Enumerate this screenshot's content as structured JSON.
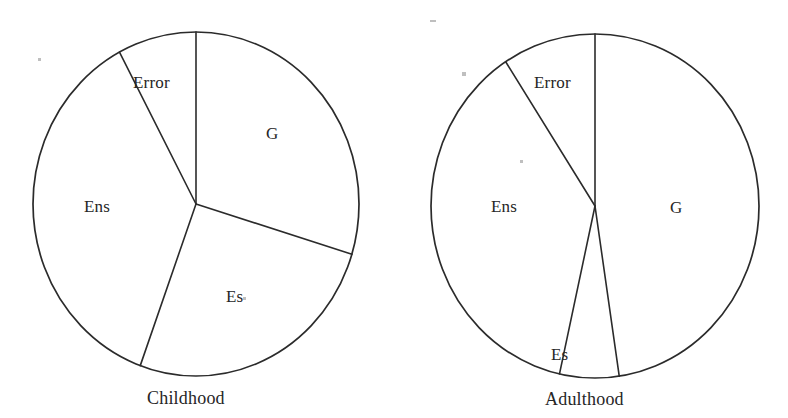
{
  "figure": {
    "background_color": "#ffffff",
    "line_color": "#2b2b2b",
    "text_color": "#262626"
  },
  "chart_data": [
    {
      "type": "pie",
      "title": "Childhood",
      "categories": [
        "G",
        "Es",
        "Ens",
        "Error"
      ],
      "values": [
        29.7,
        25.8,
        36.7,
        7.8
      ],
      "labels": [
        "G",
        "Es",
        "Ens",
        "Error"
      ],
      "units": "percent of variance",
      "legend": "none",
      "start_angle_deg": 90,
      "direction": "clockwise",
      "slice_boundaries_deg": [
        90,
        -17,
        -110,
        118
      ],
      "colors": [
        "#ffffff",
        "#ffffff",
        "#ffffff",
        "#ffffff"
      ],
      "outline_color": "#2b2b2b"
    },
    {
      "type": "pie",
      "title": "Adulthood",
      "categories": [
        "G",
        "Es",
        "Ens",
        "Error"
      ],
      "values": [
        47.5,
        6.1,
        33.6,
        12.8
      ],
      "labels": [
        "G",
        "Es",
        "Ens",
        "Error"
      ],
      "units": "percent of variance",
      "legend": "none",
      "start_angle_deg": 90,
      "direction": "clockwise",
      "slice_boundaries_deg": [
        90,
        -81,
        -103,
        123
      ],
      "colors": [
        "#ffffff",
        "#ffffff",
        "#ffffff",
        "#ffffff"
      ],
      "outline_color": "#2b2b2b"
    }
  ],
  "charts": [
    {
      "id": "childhood",
      "caption": "Childhood",
      "center": {
        "x": 196,
        "y": 204
      },
      "radius": {
        "x": 163,
        "y": 172
      },
      "caption_pos": {
        "x": 147,
        "y": 389
      },
      "boundaries_deg": [
        90,
        -17,
        -110,
        118
      ],
      "wedges": [
        {
          "name": "G",
          "label": "G",
          "label_pos": {
            "x": 266,
            "y": 125
          }
        },
        {
          "name": "Es",
          "label": "Es",
          "label_pos": {
            "x": 226,
            "y": 288
          }
        },
        {
          "name": "Ens",
          "label": "Ens",
          "label_pos": {
            "x": 84,
            "y": 198
          }
        },
        {
          "name": "Error",
          "label": "Error",
          "label_pos": {
            "x": 133,
            "y": 74
          }
        }
      ]
    },
    {
      "id": "adulthood",
      "caption": "Adulthood",
      "center": {
        "x": 595,
        "y": 206
      },
      "radius": {
        "x": 164,
        "y": 172
      },
      "caption_pos": {
        "x": 545,
        "y": 390
      },
      "boundaries_deg": [
        90,
        -81.5,
        -102.5,
        123
      ],
      "wedges": [
        {
          "name": "G",
          "label": "G",
          "label_pos": {
            "x": 670,
            "y": 199
          }
        },
        {
          "name": "Es",
          "label": "Es",
          "label_pos": {
            "x": 551,
            "y": 346
          }
        },
        {
          "name": "Ens",
          "label": "Ens",
          "label_pos": {
            "x": 491,
            "y": 198
          }
        },
        {
          "name": "Error",
          "label": "Error",
          "label_pos": {
            "x": 534,
            "y": 74
          }
        }
      ]
    }
  ]
}
